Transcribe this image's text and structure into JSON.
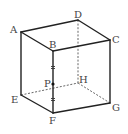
{
  "diagram": {
    "type": "cube",
    "vertices": {
      "A": {
        "label": "A",
        "x": 21,
        "y": 32
      },
      "B": {
        "label": "B",
        "x": 53,
        "y": 51
      },
      "C": {
        "label": "C",
        "x": 110,
        "y": 40
      },
      "D": {
        "label": "D",
        "x": 78,
        "y": 20
      },
      "E": {
        "label": "E",
        "x": 21,
        "y": 95
      },
      "F": {
        "label": "F",
        "x": 53,
        "y": 113
      },
      "G": {
        "label": "G",
        "x": 110,
        "y": 103
      },
      "H": {
        "label": "H",
        "x": 78,
        "y": 83
      }
    },
    "point_P": {
      "label": "P",
      "x": 53,
      "y": 84,
      "on_edge": "BF",
      "note": "midpoint marked with equal tick marks"
    },
    "visible_edges": [
      "AB",
      "BC",
      "CD",
      "DA",
      "AE",
      "BF",
      "CG",
      "EF",
      "FG"
    ],
    "hidden_edges": [
      "DH",
      "EH",
      "HG"
    ],
    "equal_marks": [
      "BP",
      "PF"
    ],
    "colors": {
      "line": "#222222",
      "hidden_line": "#555555",
      "label": "#444444",
      "background": "#ffffff"
    }
  }
}
